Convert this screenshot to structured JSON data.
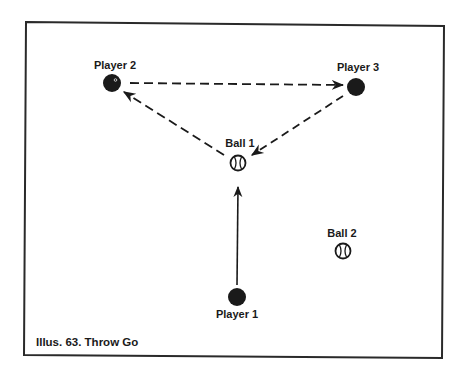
{
  "diagram": {
    "caption": "Illus. 63. Throw Go",
    "colors": {
      "ink": "#1a1a1a",
      "background": "#ffffff"
    },
    "nodes": [
      {
        "id": "player2",
        "type": "player",
        "label": "Player 2",
        "icon": "player-dot-icon"
      },
      {
        "id": "player3",
        "type": "player",
        "label": "Player 3",
        "icon": "player-dot-icon"
      },
      {
        "id": "ball1",
        "type": "ball",
        "label": "Ball 1",
        "icon": "baseball-icon"
      },
      {
        "id": "player1",
        "type": "player",
        "label": "Player 1",
        "icon": "player-dot-icon"
      },
      {
        "id": "ball2",
        "type": "ball",
        "label": "Ball 2",
        "icon": "baseball-icon"
      }
    ],
    "edges": [
      {
        "from": "player1",
        "to": "ball1",
        "style": "solid"
      },
      {
        "from": "ball1",
        "to": "player2",
        "style": "dashed"
      },
      {
        "from": "player2",
        "to": "player3",
        "style": "dashed"
      },
      {
        "from": "player3",
        "to": "ball1",
        "style": "dashed"
      }
    ]
  }
}
